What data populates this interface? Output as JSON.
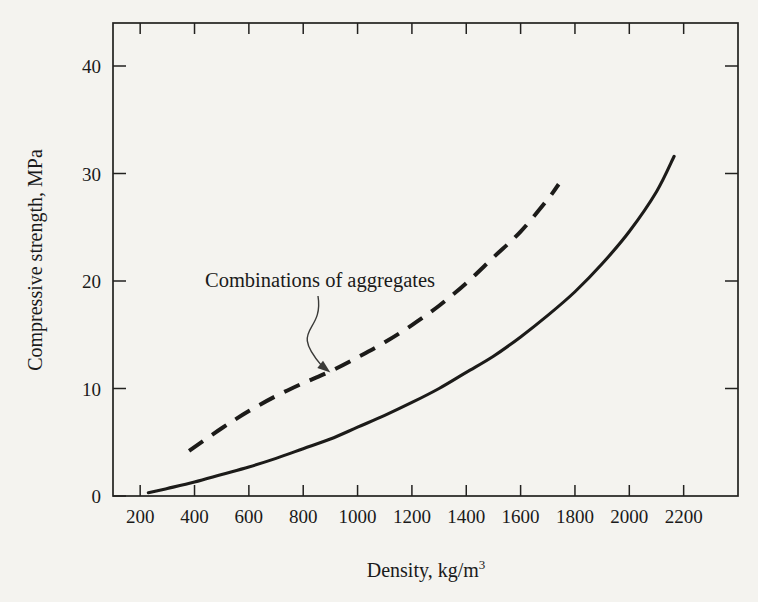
{
  "chart_data": {
    "type": "line",
    "title": "",
    "subtitle": "",
    "xlabel": "Density, kg/m",
    "xlabel_superscript": "3",
    "ylabel": "Compressive strength, MPa",
    "xlim": [
      100,
      2400
    ],
    "ylim": [
      0,
      44
    ],
    "xticks": [
      200,
      400,
      600,
      800,
      1000,
      1200,
      1400,
      1600,
      1800,
      2000,
      2200
    ],
    "xtick_labels": [
      "200",
      "400",
      "600",
      "800",
      "1000",
      "1200",
      "1400",
      "1600",
      "1800",
      "2000",
      "2200"
    ],
    "yticks": [
      0,
      10,
      20,
      30,
      40
    ],
    "ytick_labels": [
      "0",
      "10",
      "20",
      "30",
      "40"
    ],
    "grid": false,
    "legend_position": "none",
    "frame": "box",
    "tick_direction": "in",
    "series": [
      {
        "name": "Lightweight aggregate concrete",
        "style": "solid",
        "color": "#1c1b19",
        "x": [
          230,
          300,
          400,
          500,
          600,
          700,
          800,
          900,
          1000,
          1100,
          1200,
          1300,
          1400,
          1500,
          1600,
          1700,
          1800,
          1900,
          2000,
          2100,
          2165
        ],
        "y": [
          0.3,
          0.7,
          1.3,
          2.0,
          2.7,
          3.5,
          4.4,
          5.3,
          6.4,
          7.5,
          8.7,
          10.0,
          11.5,
          13.0,
          14.8,
          16.8,
          19.0,
          21.6,
          24.6,
          28.3,
          31.6
        ]
      },
      {
        "name": "Combinations of aggregates",
        "style": "dashed",
        "color": "#1c1b19",
        "x": [
          380,
          500,
          600,
          700,
          800,
          900,
          1000,
          1100,
          1200,
          1300,
          1400,
          1500,
          1600,
          1700,
          1740
        ],
        "y": [
          4.2,
          6.3,
          7.9,
          9.3,
          10.5,
          11.6,
          12.9,
          14.3,
          15.9,
          17.7,
          19.8,
          22.2,
          24.6,
          27.6,
          29.0
        ]
      }
    ],
    "annotations": [
      {
        "text": "Combinations of aggregates",
        "text_x": 430,
        "text_y": 20.6,
        "arrow_target_x": 900,
        "arrow_target_y": 11.5,
        "style": "curved-arrow"
      }
    ]
  },
  "colors": {
    "background": "#f4f3ef",
    "ink": "#1c1b19",
    "axis": "#22211f",
    "annotation": "#3a3a38"
  }
}
